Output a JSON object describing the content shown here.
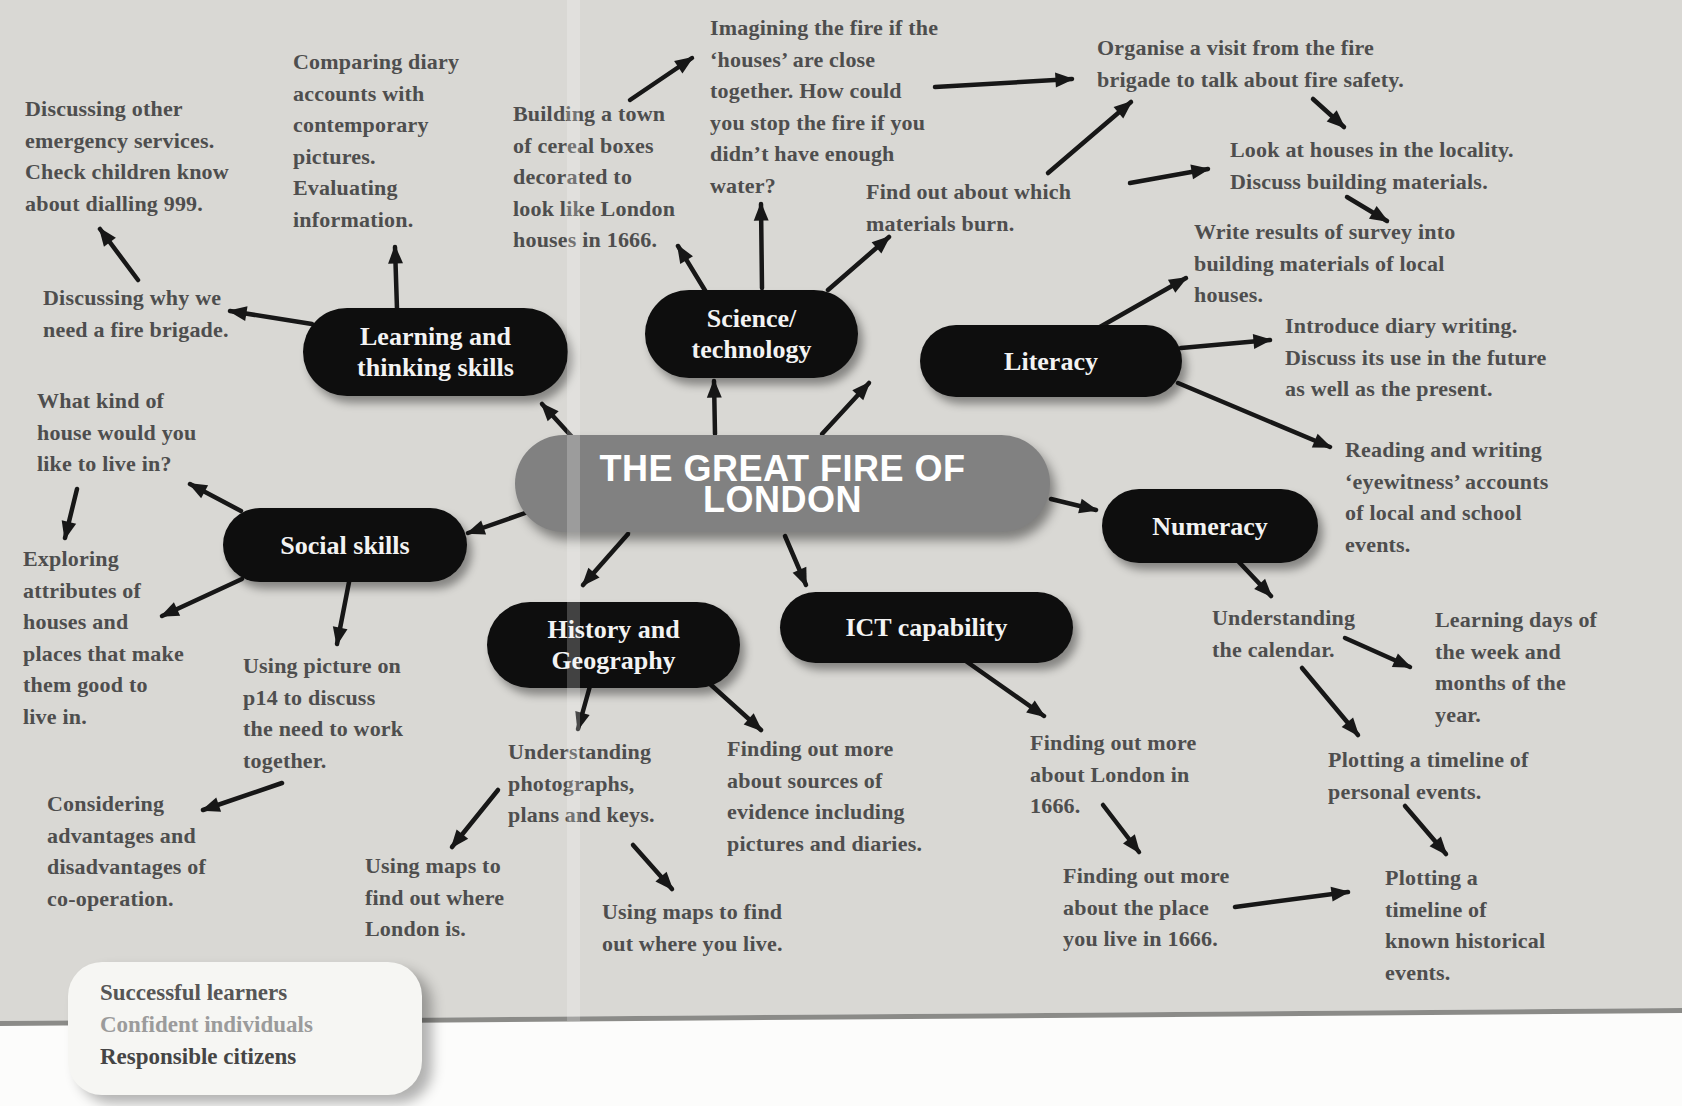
{
  "title": "THE GREAT FIRE OF LONDON",
  "nodes": {
    "learning": {
      "label": "Learning and\nthinking skills"
    },
    "science": {
      "label": "Science/\ntechnology"
    },
    "literacy": {
      "label": "Literacy"
    },
    "social": {
      "label": "Social skills"
    },
    "history": {
      "label": "History and\nGeography"
    },
    "ict": {
      "label": "ICT capability"
    },
    "numeracy": {
      "label": "Numeracy"
    }
  },
  "annotations": [
    {
      "id": "discussing-other-emergency",
      "text": "Discussing other\nemergency services.\nCheck children know\nabout dialling 999."
    },
    {
      "id": "discussing-why-fire-brigade",
      "text": "Discussing why we\nneed a fire brigade."
    },
    {
      "id": "comparing-diary-accounts",
      "text": "Comparing diary\naccounts with\ncontemporary\npictures.\nEvaluating\ninformation."
    },
    {
      "id": "building-a-town",
      "text": "Building a town\nof cereal boxes\ndecorated to\nlook like London\nhouses in 1666."
    },
    {
      "id": "imagining-the-fire",
      "text": "Imagining the fire if the\n‘houses’ are close\ntogether. How could\nyou stop the fire if you\ndidn’t have enough\nwater?"
    },
    {
      "id": "organise-a-visit",
      "text": "Organise a visit from the fire\nbrigade to talk about fire safety."
    },
    {
      "id": "find-out-materials-burn",
      "text": "Find out about which\nmaterials burn."
    },
    {
      "id": "look-at-houses",
      "text": "Look at houses in the locality.\nDiscuss building materials."
    },
    {
      "id": "write-results-survey",
      "text": "Write results of survey into\nbuilding materials of local\nhouses."
    },
    {
      "id": "introduce-diary-writing",
      "text": "Introduce diary writing.\nDiscuss its use in the future\nas well as the present."
    },
    {
      "id": "reading-writing-eyewitness",
      "text": "Reading and writing\n‘eyewitness’ accounts\nof local and school\nevents."
    },
    {
      "id": "what-kind-of-house",
      "text": "What kind of\nhouse would you\nlike to live in?"
    },
    {
      "id": "exploring-attributes",
      "text": "Exploring\nattributes of\nhouses and\nplaces that make\nthem good to\nlive in."
    },
    {
      "id": "using-picture-p14",
      "text": "Using picture on\np14 to discuss\nthe need to work\ntogether."
    },
    {
      "id": "considering-advantages",
      "text": "Considering\nadvantages and\ndisadvantages of\nco-operation."
    },
    {
      "id": "understanding-photographs",
      "text": "Understanding\nphotographs,\nplans and keys."
    },
    {
      "id": "using-maps-london",
      "text": "Using maps to\nfind out where\nLondon is."
    },
    {
      "id": "using-maps-you-live",
      "text": "Using maps to find\nout where you live."
    },
    {
      "id": "finding-sources-evidence",
      "text": "Finding out more\nabout sources of\nevidence including\npictures and diaries."
    },
    {
      "id": "finding-london-1666",
      "text": "Finding out more\nabout London in\n1666."
    },
    {
      "id": "finding-place-1666",
      "text": "Finding out more\nabout the place\nyou live in 1666."
    },
    {
      "id": "understanding-calendar",
      "text": "Understanding\nthe calendar."
    },
    {
      "id": "learning-days",
      "text": "Learning days of\nthe week and\nmonths of the\nyear."
    },
    {
      "id": "plotting-personal",
      "text": "Plotting a timeline of\npersonal events."
    },
    {
      "id": "plotting-historical",
      "text": "Plotting a\ntimeline of\nknown historical\nevents."
    }
  ],
  "footer_box": {
    "lines": [
      "Successful learners",
      "Confident individuals",
      "Responsible citizens"
    ]
  },
  "colors": {
    "paper": "#d9d8d4",
    "node_fill": "#0e0e0e",
    "node_text": "#f3f3f3",
    "central_fill": "#818181",
    "central_text": "#ffffff",
    "annotation_text": "#4e4e4e",
    "arrow": "#171717",
    "values_box_fill": "#f6f6f3"
  }
}
